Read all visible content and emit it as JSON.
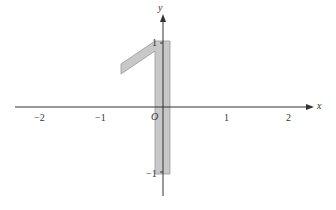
{
  "diagram": {
    "axes": {
      "x_label": "x",
      "y_label": "y",
      "origin_label": "O"
    },
    "x_ticks": [
      "−2",
      "−1",
      "1",
      "2"
    ],
    "y_ticks": [
      "1",
      "−1"
    ],
    "shape": {
      "description": "shaded figure of the digit 1",
      "fill": "#c8c8c8",
      "stroke": "#999999"
    }
  }
}
